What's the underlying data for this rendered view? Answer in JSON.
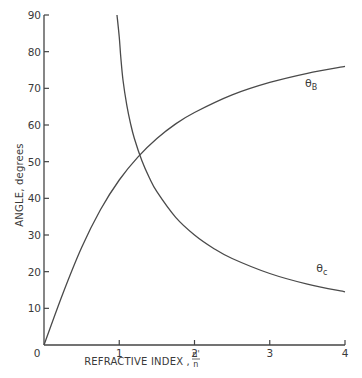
{
  "chart_data": {
    "type": "line",
    "title": "",
    "xlabel": "REFRACTIVE INDEX , n'/n",
    "xlabel_main": "REFRACTIVE INDEX ,",
    "xlabel_frac_num": "n'",
    "xlabel_frac_den": "n",
    "ylabel": "ANGLE, degrees",
    "xlim": [
      0,
      4
    ],
    "ylim": [
      0,
      90
    ],
    "x_ticks": [
      0,
      1,
      2,
      3,
      4
    ],
    "x_tick_labels": [
      "0",
      "1",
      "2",
      "3",
      "4"
    ],
    "y_ticks": [
      10,
      20,
      30,
      40,
      50,
      60,
      70,
      80,
      90
    ],
    "y_tick_labels": [
      "10",
      "20",
      "30",
      "40",
      "50",
      "60",
      "70",
      "80",
      "90"
    ],
    "grid": false,
    "legend": "inline labels",
    "series": [
      {
        "name": "θB",
        "label_main": "θ",
        "label_sub": "B",
        "x": [
          0,
          0.25,
          0.5,
          0.75,
          1.0,
          1.25,
          1.5,
          1.75,
          2.0,
          2.5,
          3.0,
          3.5,
          4.0
        ],
        "values": [
          0,
          14.0,
          26.6,
          36.9,
          45.0,
          51.3,
          56.3,
          60.3,
          63.4,
          68.2,
          71.6,
          74.1,
          76.0
        ],
        "label_pos": [
          3.6,
          71.5
        ]
      },
      {
        "name": "θc",
        "label_main": "θ",
        "label_sub": "c",
        "x": [
          0.97,
          1.0,
          1.02,
          1.05,
          1.1,
          1.15,
          1.2,
          1.3,
          1.4,
          1.5,
          1.75,
          2.0,
          2.25,
          2.5,
          3.0,
          3.5,
          4.0
        ],
        "values": [
          90,
          84,
          78.6,
          72.2,
          65.4,
          60.4,
          56.4,
          50.3,
          45.6,
          41.8,
          34.8,
          30.0,
          26.4,
          23.6,
          19.5,
          16.6,
          14.5
        ],
        "label_pos": [
          3.75,
          21
        ]
      }
    ]
  }
}
